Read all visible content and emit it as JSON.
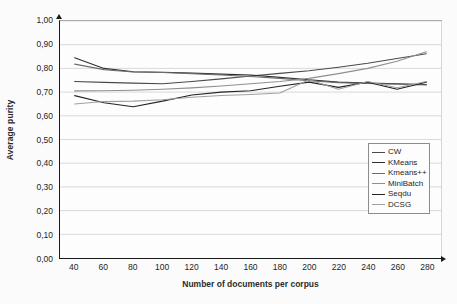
{
  "chart_data": {
    "type": "line",
    "title": "",
    "xlabel": "Number of documents per corpus",
    "ylabel": "Average purity",
    "xlim": [
      30,
      290
    ],
    "ylim": [
      0.0,
      1.0
    ],
    "grid": "horizontal",
    "legend_position": "right-inside",
    "x": [
      40,
      60,
      80,
      100,
      120,
      140,
      160,
      180,
      200,
      220,
      240,
      260,
      280
    ],
    "y_tick_labels": [
      "0,00",
      "0,10",
      "0,20",
      "0,30",
      "0,40",
      "0,50",
      "0,60",
      "0,70",
      "0,80",
      "0,90",
      "1,00"
    ],
    "y_tick_values": [
      0.0,
      0.1,
      0.2,
      0.3,
      0.4,
      0.5,
      0.6,
      0.7,
      0.8,
      0.9,
      1.0
    ],
    "x_tick_labels": [
      "40",
      "60",
      "80",
      "100",
      "120",
      "140",
      "160",
      "180",
      "200",
      "220",
      "240",
      "260",
      "280"
    ],
    "series": [
      {
        "name": "CW",
        "color": "#4a4a4a",
        "width": 1.2,
        "values": [
          0.745,
          0.741,
          0.738,
          0.735,
          0.745,
          0.756,
          0.768,
          0.779,
          0.79,
          0.805,
          0.822,
          0.842,
          0.862
        ]
      },
      {
        "name": "KMeans",
        "color": "#2e2e2e",
        "width": 1.2,
        "values": [
          0.845,
          0.8,
          0.786,
          0.784,
          0.78,
          0.776,
          0.772,
          0.762,
          0.752,
          0.742,
          0.738,
          0.735,
          0.732
        ]
      },
      {
        "name": "Kmeans++",
        "color": "#6d6d6d",
        "width": 1.1,
        "values": [
          0.818,
          0.795,
          0.785,
          0.783,
          0.778,
          0.772,
          0.766,
          0.758,
          0.748,
          0.74,
          0.736,
          0.733,
          0.73
        ]
      },
      {
        "name": "MiniBatch",
        "color": "#8f8f8f",
        "width": 1.0,
        "values": [
          0.705,
          0.706,
          0.708,
          0.712,
          0.718,
          0.726,
          0.735,
          0.745,
          0.758,
          0.778,
          0.8,
          0.83,
          0.87
        ]
      },
      {
        "name": "Seqdu",
        "color": "#242424",
        "width": 1.3,
        "values": [
          0.685,
          0.655,
          0.638,
          0.662,
          0.688,
          0.7,
          0.706,
          0.725,
          0.742,
          0.72,
          0.742,
          0.712,
          0.742
        ]
      },
      {
        "name": "DCSG",
        "color": "#a0a0a0",
        "width": 1.0,
        "values": [
          0.65,
          0.66,
          0.662,
          0.668,
          0.678,
          0.686,
          0.69,
          0.696,
          0.752,
          0.712,
          0.745,
          0.718,
          0.745
        ]
      }
    ]
  }
}
